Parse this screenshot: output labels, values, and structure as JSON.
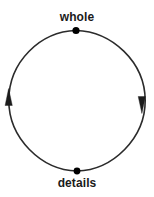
{
  "diagram": {
    "type": "cycle",
    "direction": "clockwise",
    "background_color": "#ffffff",
    "stroke_color": "#2b2b2b",
    "node_color": "#000000",
    "label_color": "#1a1a1a",
    "circle": {
      "center_x": 76,
      "center_y": 100.5,
      "radius_x": 69,
      "radius_y": 70,
      "stroke_width": 1.6
    },
    "nodes": [
      {
        "id": "whole",
        "label": "whole",
        "x": 76,
        "y": 30,
        "dot_radius": 3.6,
        "label_position": "above"
      },
      {
        "id": "details",
        "label": "details",
        "x": 77,
        "y": 171,
        "dot_radius": 3.4,
        "label_position": "below"
      }
    ],
    "arrows": [
      {
        "id": "arrow-right-down",
        "position": "right",
        "points": "down",
        "x": 142,
        "y": 101
      },
      {
        "id": "arrow-left-up",
        "position": "left",
        "points": "up",
        "x": 8,
        "y": 101
      }
    ]
  }
}
